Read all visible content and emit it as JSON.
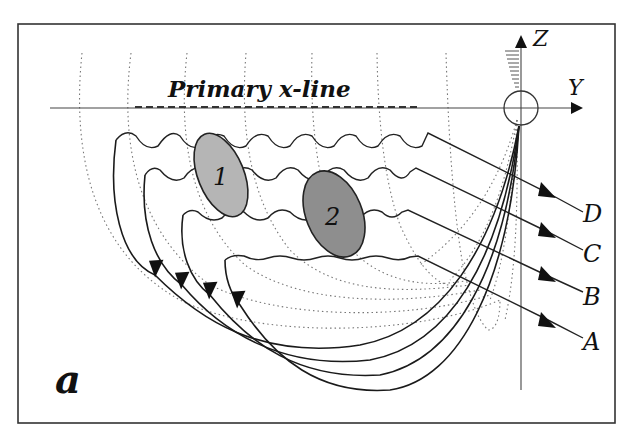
{
  "figure": {
    "panel_label": "a",
    "title_line": "Primary x-line",
    "axes": {
      "z_label": "Z",
      "y_label": "Y"
    },
    "regions": [
      {
        "id": "1",
        "label": "1",
        "shade": "#b5b5b5"
      },
      {
        "id": "2",
        "label": "2",
        "shade": "#8e8e8e"
      }
    ],
    "field_lines": [
      {
        "label": "D"
      },
      {
        "label": "C"
      },
      {
        "label": "B"
      },
      {
        "label": "A"
      }
    ],
    "colors": {
      "ink": "#1a1a1a",
      "grid": "#777777",
      "background": "#ffffff"
    }
  }
}
